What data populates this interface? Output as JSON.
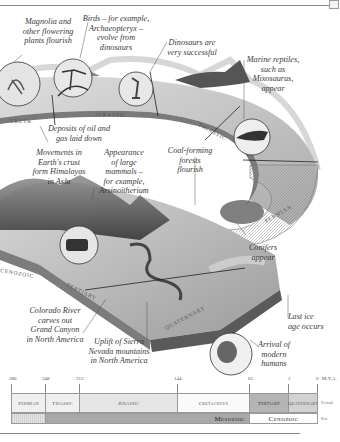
{
  "figure": {
    "band_labels": [
      "Cretaceous",
      "Jurassic",
      "Triassic",
      "Permian",
      "Tertiary",
      "Quaternary"
    ]
  },
  "annotations": [
    {
      "id": "magnolia",
      "text": "Magnolia and\nother flowering\nplants flourish"
    },
    {
      "id": "birds",
      "text": "Birds – for example,\nArchaeopteryx –\nevolve from\ndinosaurs"
    },
    {
      "id": "dinosaurs",
      "text": "Dinosaurs are\nvery successful"
    },
    {
      "id": "marine",
      "text": "Marine reptiles,\nsuch as\nMixosaurus,\nappear"
    },
    {
      "id": "oil",
      "text": "Deposits of oil and\ngas laid down"
    },
    {
      "id": "himalayas",
      "text": "Movements in\nEarth's crust\nform Himalayas\nin Asia"
    },
    {
      "id": "mammals",
      "text": "Appearance\nof large\nmammals –\nfor example,\nArsinoitherium"
    },
    {
      "id": "coal",
      "text": "Coal-forming\nforests\nflourish"
    },
    {
      "id": "conifers",
      "text": "Conifers\nappear"
    },
    {
      "id": "colorado",
      "text": "Colorado River\ncarves out\nGrand Canyon\nin North America"
    },
    {
      "id": "sierra",
      "text": "Uplift of Sierra\nNevada mountains\nin North America"
    },
    {
      "id": "ice",
      "text": "Last ice\nage occurs"
    },
    {
      "id": "humans",
      "text": "Arrival of\nmodern\nhumans"
    }
  ],
  "timeline": {
    "unit_label": "M.Y.A.",
    "ticks": [
      "286",
      "248",
      "213",
      "144",
      "65",
      "2",
      "0"
    ],
    "periods": [
      "Permian",
      "Triassic",
      "Jurassic",
      "Cretaceous",
      "Tertiary",
      "Quaternary"
    ],
    "eras": [
      "Mesozoic",
      "Cenozoic"
    ],
    "row_labels": {
      "period": "Period",
      "era": "Era"
    }
  },
  "colors": {
    "mesozoic_bar": "#a8a8a8",
    "tertiary": "#b4b4b4",
    "quaternary": "#d2d2d2",
    "period_light": "#ececec"
  }
}
